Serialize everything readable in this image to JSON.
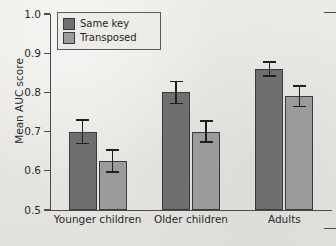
{
  "chart_data": {
    "type": "bar",
    "title": "",
    "xlabel": "",
    "ylabel": "Mean AUC score",
    "ylim": [
      0.5,
      1.0
    ],
    "ytick_labels": [
      "1.0",
      "0.9",
      "0.8",
      "0.7",
      "0.6",
      "0.5"
    ],
    "ytick_values": [
      1.0,
      0.9,
      0.8,
      0.7,
      0.6,
      0.5
    ],
    "grid": false,
    "legend_position": "top-left",
    "categories": [
      "Younger children",
      "Older children",
      "Adults"
    ],
    "series": [
      {
        "name": "Same key",
        "color": "#6f6f6f",
        "values": [
          0.7,
          0.8,
          0.86
        ],
        "errors": [
          0.03,
          0.028,
          0.018
        ]
      },
      {
        "name": "Transposed",
        "color": "#9b9b9b",
        "values": [
          0.625,
          0.7,
          0.79
        ],
        "errors": [
          0.028,
          0.027,
          0.026
        ]
      }
    ]
  },
  "legend": {
    "items": [
      {
        "label": "Same key",
        "swatch": "same"
      },
      {
        "label": "Transposed",
        "swatch": "transposed"
      }
    ]
  }
}
